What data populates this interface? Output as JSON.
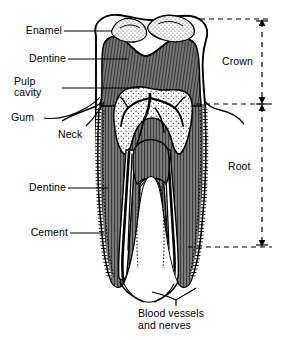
{
  "figure": {
    "background_color": "#ffffff",
    "ink_color": "#000000",
    "dentine_fill": "#6e6e6e",
    "enamel_fill": "#ffffff",
    "pulp_fill": "#f2f2f2",
    "stipple_color": "#555555"
  },
  "labels": {
    "enamel": "Enamel",
    "dentine_crown": "Dentine",
    "pulp_cavity_line1": "Pulp",
    "pulp_cavity_line2": "cavity",
    "gum": "Gum",
    "neck": "Neck",
    "dentine_root": "Dentine",
    "cement": "Cement",
    "blood_line1": "Blood vessels",
    "blood_line2": "and nerves",
    "crown": "Crown",
    "root": "Root"
  },
  "dimensions": {
    "crown_top_y": 19,
    "crown_bottom_y": 104,
    "root_top_y": 104,
    "root_bottom_y": 247,
    "bracket_x": 262
  }
}
